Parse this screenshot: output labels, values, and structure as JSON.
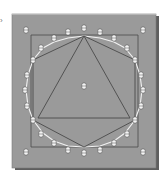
{
  "figure": {
    "corner_mark": "›",
    "board": {
      "x": 12,
      "y": 14,
      "w": 144,
      "h": 154,
      "fill": "#9a9a9a",
      "shadow": "#5e5e5e",
      "top_edge": "#b5b5b5"
    },
    "square": {
      "points": [
        [
          31,
          35
        ],
        [
          138,
          35
        ],
        [
          138,
          147
        ],
        [
          31,
          147
        ]
      ],
      "stroke": "#4a4a4a"
    },
    "hexagon": {
      "points": [
        [
          84,
          36
        ],
        [
          135,
          60
        ],
        [
          135,
          120
        ],
        [
          84,
          147
        ],
        [
          33,
          120
        ],
        [
          33,
          60
        ]
      ],
      "stroke": "#4a4a4a"
    },
    "triangle": {
      "points": [
        [
          84,
          36
        ],
        [
          130,
          118
        ],
        [
          38,
          118
        ]
      ],
      "stroke": "#4a4a4a"
    },
    "circle_polygon": {
      "points": [
        [
          84,
          36
        ],
        [
          100,
          38
        ],
        [
          114,
          42
        ],
        [
          125,
          48
        ],
        [
          135,
          60
        ],
        [
          140,
          75
        ],
        [
          142,
          90
        ],
        [
          140,
          106
        ],
        [
          135,
          120
        ],
        [
          125,
          133
        ],
        [
          114,
          141
        ],
        [
          100,
          146
        ],
        [
          84,
          147
        ],
        [
          68,
          146
        ],
        [
          54,
          141
        ],
        [
          43,
          133
        ],
        [
          33,
          120
        ],
        [
          28,
          106
        ],
        [
          26,
          90
        ],
        [
          28,
          75
        ],
        [
          33,
          60
        ],
        [
          43,
          48
        ],
        [
          54,
          42
        ],
        [
          68,
          38
        ]
      ],
      "stroke": "#f2f2f2"
    },
    "pegs": [
      [
        26,
        30
      ],
      [
        54,
        38
      ],
      [
        68,
        32
      ],
      [
        84,
        28
      ],
      [
        100,
        32
      ],
      [
        114,
        38
      ],
      [
        143,
        30
      ],
      [
        41,
        48
      ],
      [
        127,
        48
      ],
      [
        33,
        60
      ],
      [
        135,
        60
      ],
      [
        27,
        75
      ],
      [
        141,
        75
      ],
      [
        25,
        90
      ],
      [
        143,
        90
      ],
      [
        27,
        106
      ],
      [
        141,
        106
      ],
      [
        33,
        120
      ],
      [
        135,
        120
      ],
      [
        41,
        134
      ],
      [
        127,
        134
      ],
      [
        26,
        152
      ],
      [
        54,
        143
      ],
      [
        68,
        150
      ],
      [
        84,
        153
      ],
      [
        100,
        150
      ],
      [
        114,
        143
      ],
      [
        143,
        152
      ],
      [
        84,
        86
      ]
    ],
    "peg_color": "#f4f4f4",
    "peg_outline": "#555555"
  }
}
